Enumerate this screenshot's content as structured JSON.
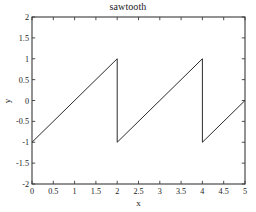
{
  "figure": {
    "title": "sawtooth",
    "background_color": "#ffffff",
    "axes_color": "#3a3a3a",
    "line_color": "#2b2b2b"
  },
  "chart_data": {
    "type": "line",
    "title": "sawtooth",
    "xlabel": "x",
    "ylabel": "y",
    "xlim": [
      0,
      5
    ],
    "ylim": [
      -2,
      2
    ],
    "grid": false,
    "legend": null,
    "xticks": [
      0,
      0.5,
      1,
      1.5,
      2,
      2.5,
      3,
      3.5,
      4,
      4.5,
      5
    ],
    "xtick_labels": [
      "0",
      "0.5",
      "1",
      "1.5",
      "2",
      "2.5",
      "3",
      "3.5",
      "4",
      "4.5",
      "5"
    ],
    "yticks": [
      -2,
      -1.5,
      -1,
      -0.5,
      0,
      0.5,
      1,
      1.5,
      2
    ],
    "ytick_labels": [
      "-2",
      "-1.5",
      "-1",
      "-0.5",
      "0",
      "0.5",
      "1",
      "1.5",
      "2"
    ],
    "series": [
      {
        "name": "sawtooth",
        "period": 2,
        "amplitude": 1,
        "description": "Sawtooth wave rising linearly from -1 to 1 over each period of 2, with vertical drops at x=2 and x=4",
        "segments": [
          {
            "x": [
              0,
              2
            ],
            "y": [
              -1,
              1
            ]
          },
          {
            "x": [
              2,
              2
            ],
            "y": [
              1,
              -1
            ]
          },
          {
            "x": [
              2,
              4
            ],
            "y": [
              -1,
              1
            ]
          },
          {
            "x": [
              4,
              4
            ],
            "y": [
              1,
              -1
            ]
          },
          {
            "x": [
              4,
              5
            ],
            "y": [
              -1,
              0
            ]
          }
        ],
        "points": [
          {
            "x": 0,
            "y": -1
          },
          {
            "x": 0.5,
            "y": -0.5
          },
          {
            "x": 1,
            "y": 0
          },
          {
            "x": 1.5,
            "y": 0.5
          },
          {
            "x": 2,
            "y": 1
          },
          {
            "x": 2,
            "y": -1
          },
          {
            "x": 2.5,
            "y": -0.5
          },
          {
            "x": 3,
            "y": 0
          },
          {
            "x": 3.5,
            "y": 0.5
          },
          {
            "x": 4,
            "y": 1
          },
          {
            "x": 4,
            "y": -1
          },
          {
            "x": 4.5,
            "y": -0.5
          },
          {
            "x": 5,
            "y": 0
          }
        ]
      }
    ]
  }
}
